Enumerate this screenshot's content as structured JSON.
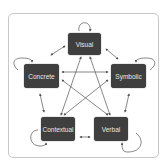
{
  "diagram": {
    "nodes": [
      {
        "id": "visual",
        "label": "Visual"
      },
      {
        "id": "concrete",
        "label": "Concrete"
      },
      {
        "id": "symbolic",
        "label": "Symbolic"
      },
      {
        "id": "contextual",
        "label": "Contextual"
      },
      {
        "id": "verbal",
        "label": "Verbal"
      }
    ],
    "edges": [
      [
        "visual",
        "concrete"
      ],
      [
        "visual",
        "symbolic"
      ],
      [
        "concrete",
        "contextual"
      ],
      [
        "symbolic",
        "verbal"
      ],
      [
        "contextual",
        "verbal"
      ],
      [
        "visual",
        "contextual"
      ],
      [
        "visual",
        "verbal"
      ],
      [
        "concrete",
        "symbolic"
      ],
      [
        "concrete",
        "verbal"
      ],
      [
        "symbolic",
        "contextual"
      ]
    ],
    "self_loops": [
      "visual",
      "concrete",
      "symbolic",
      "contextual",
      "verbal"
    ],
    "colors": {
      "node": "#3f3f3f",
      "text": "#e8e8e8",
      "edge": "#555555",
      "frame": "#c8c8c8"
    }
  }
}
